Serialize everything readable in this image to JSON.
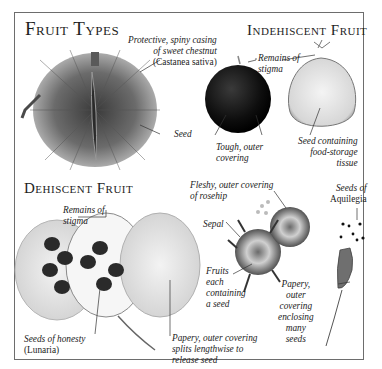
{
  "sections": {
    "fruit_types": {
      "title": "Fruit Types"
    },
    "indehiscent": {
      "title": "Indehiscent Fruit"
    },
    "dehiscent": {
      "title": "Dehiscent Fruit"
    }
  },
  "labels": {
    "chestnut_casing": {
      "line1": "Protective, spiny casing",
      "line2": "of sweet chestnut",
      "line3": "(Castanea sativa)"
    },
    "seed": "Seed",
    "tough_covering": {
      "line1": "Tough, outer",
      "line2": "covering"
    },
    "remains_stigma_top": {
      "line1": "Remains of",
      "line2": "stigma"
    },
    "seed_food_storage": {
      "line1": "Seed containing",
      "line2": "food-storage",
      "line3": "tissue"
    },
    "remains_stigma_bottom": {
      "line1": "Remains of",
      "line2": "stigma"
    },
    "rosehip_covering": {
      "line1": "Fleshy, outer covering",
      "line2": "of rosehip"
    },
    "sepal": "Sepal",
    "fruits_each_seed": {
      "line1": "Fruits",
      "line2": "each",
      "line3": "containing",
      "line4": "a seed"
    },
    "aquilegia_seeds": {
      "line1": "Seeds of",
      "line2": "Aquilegia"
    },
    "papery_enclosing": {
      "line1": "Papery,",
      "line2": "outer",
      "line3": "covering",
      "line4": "enclosing",
      "line5": "many",
      "line6": "seeds"
    },
    "honesty_seeds": {
      "line1": "Seeds of honesty",
      "line2": "(Lunaria)"
    },
    "papery_splits": {
      "line1": "Papery, outer covering",
      "line2": "splits lengthwise to",
      "line3": "release seed"
    }
  },
  "illustrations": [
    "chestnut-casing",
    "chestnut-seed",
    "chestnut-cut",
    "honesty-pods",
    "rosehip-cut",
    "aquilegia-pod"
  ],
  "colors": {
    "frame": "#6d6d6d",
    "text": "#1e1e1e",
    "leader": "#333333"
  }
}
